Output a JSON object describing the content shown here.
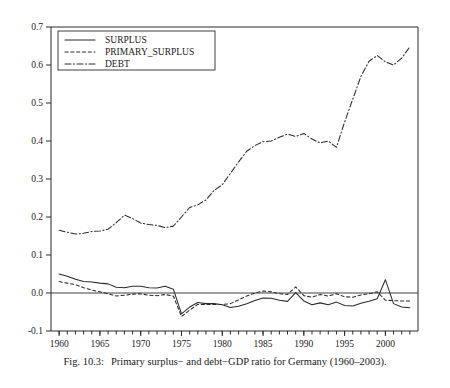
{
  "caption": {
    "figure_number": "Fig. 10.3:",
    "text": "Primary surplus− and debt−GDP ratio for Germany (1960–2003)."
  },
  "legend": {
    "position": "top-left",
    "entries": [
      {
        "label": "SURPLUS",
        "style": "solid",
        "key": "surplus"
      },
      {
        "label": "PRIMARY_SURPLUS",
        "style": "dashed",
        "key": "primary_surplus"
      },
      {
        "label": "DEBT",
        "style": "dash-dot",
        "key": "debt"
      }
    ]
  },
  "axes": {
    "y_ticks": [
      "0.7",
      "0.6",
      "0.5",
      "0.4",
      "0.3",
      "0.2",
      "0.1",
      "0.0",
      "-0.1"
    ],
    "x_ticks": [
      "1960",
      "1965",
      "1970",
      "1975",
      "1980",
      "1985",
      "1990",
      "1995",
      "2000"
    ],
    "ylabel": "",
    "xlabel": ""
  },
  "chart_data": {
    "type": "line",
    "title": "",
    "xlabel": "",
    "ylabel": "",
    "xlim": [
      1959,
      2004
    ],
    "ylim": [
      -0.1,
      0.7
    ],
    "grid": false,
    "legend_position": "top-left",
    "x": [
      1960,
      1961,
      1962,
      1963,
      1964,
      1965,
      1966,
      1967,
      1968,
      1969,
      1970,
      1971,
      1972,
      1973,
      1974,
      1975,
      1976,
      1977,
      1978,
      1979,
      1980,
      1981,
      1982,
      1983,
      1984,
      1985,
      1986,
      1987,
      1988,
      1989,
      1990,
      1991,
      1992,
      1993,
      1994,
      1995,
      1996,
      1997,
      1998,
      1999,
      2000,
      2001,
      2002,
      2003
    ],
    "series": [
      {
        "name": "SURPLUS",
        "style": "solid",
        "values": [
          0.05,
          0.044,
          0.036,
          0.03,
          0.029,
          0.026,
          0.024,
          0.015,
          0.014,
          0.018,
          0.018,
          0.014,
          0.013,
          0.018,
          0.01,
          -0.055,
          -0.037,
          -0.025,
          -0.028,
          -0.028,
          -0.031,
          -0.038,
          -0.035,
          -0.028,
          -0.02,
          -0.013,
          -0.014,
          -0.019,
          -0.022,
          0.001,
          -0.021,
          -0.031,
          -0.026,
          -0.031,
          -0.024,
          -0.033,
          -0.034,
          -0.027,
          -0.022,
          -0.015,
          0.035,
          -0.028,
          -0.037,
          -0.039
        ]
      },
      {
        "name": "PRIMARY_SURPLUS",
        "style": "dashed",
        "values": [
          0.03,
          0.026,
          0.022,
          0.014,
          0.008,
          0.003,
          -0.002,
          -0.008,
          -0.006,
          -0.003,
          -0.002,
          -0.006,
          -0.007,
          -0.004,
          -0.008,
          -0.062,
          -0.045,
          -0.03,
          -0.03,
          -0.03,
          -0.03,
          -0.028,
          -0.018,
          -0.008,
          0.0,
          0.005,
          0.003,
          -0.002,
          -0.004,
          0.016,
          -0.007,
          -0.011,
          -0.004,
          -0.008,
          -0.002,
          -0.01,
          -0.011,
          -0.005,
          -0.002,
          0.003,
          -0.019,
          -0.02,
          -0.021,
          -0.021
        ]
      },
      {
        "name": "DEBT",
        "style": "dash-dot",
        "values": [
          0.165,
          0.16,
          0.155,
          0.157,
          0.162,
          0.163,
          0.168,
          0.185,
          0.205,
          0.196,
          0.184,
          0.18,
          0.178,
          0.172,
          0.176,
          0.2,
          0.225,
          0.232,
          0.245,
          0.27,
          0.285,
          0.315,
          0.345,
          0.373,
          0.388,
          0.398,
          0.4,
          0.41,
          0.418,
          0.412,
          0.42,
          0.405,
          0.395,
          0.4,
          0.383,
          0.45,
          0.51,
          0.57,
          0.61,
          0.625,
          0.608,
          0.6,
          0.618,
          0.648
        ]
      }
    ]
  }
}
